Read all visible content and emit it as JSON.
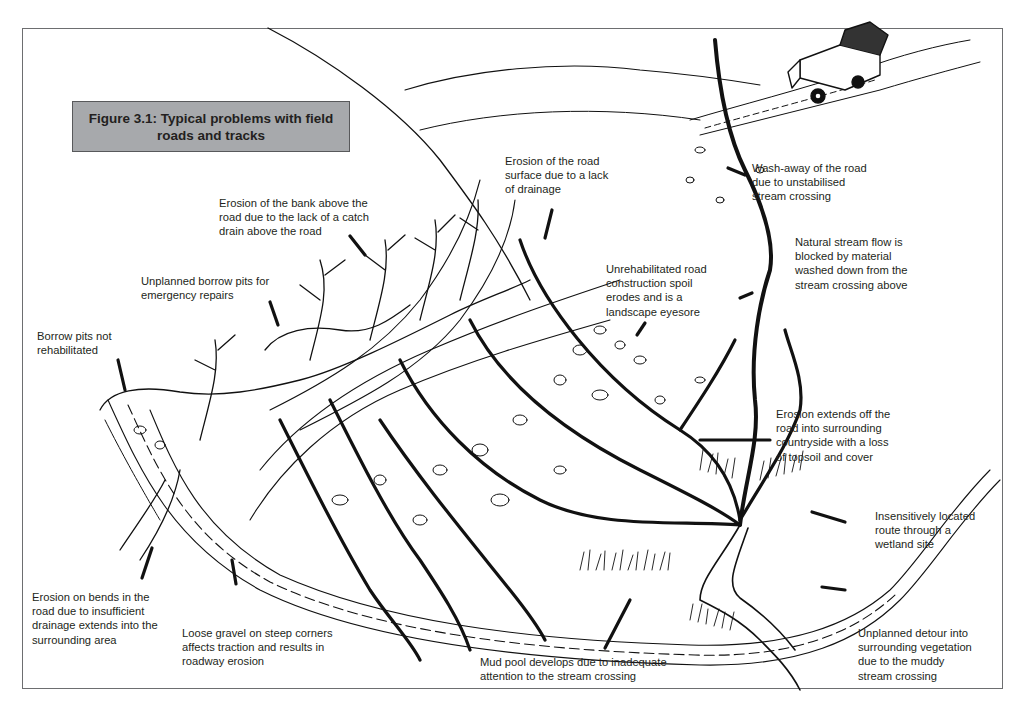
{
  "figure": {
    "title": "Figure 3.1: Typical problems with field\nroads and tracks",
    "colors": {
      "title_box_fill": "#a7a9ac",
      "frame": "#6d6e70",
      "ink": "#111111",
      "text": "#231f20"
    }
  },
  "annotations": [
    {
      "id": "road-surface-erosion",
      "text": "Erosion of the road\nsurface due to a lack\nof drainage"
    },
    {
      "id": "wash-away",
      "text": "Wash-away of the road\ndue to unstabilised\nstream crossing"
    },
    {
      "id": "bank-erosion",
      "text": "Erosion of the bank above the\nroad due to the lack of a catch\ndrain above the road"
    },
    {
      "id": "stream-blocked",
      "text": "Natural stream flow is\nblocked by material\nwashed down from the\nstream crossing above"
    },
    {
      "id": "unplanned-borrow-pits",
      "text": "Unplanned borrow pits for\nemergency repairs"
    },
    {
      "id": "spoil-eyesore",
      "text": "Unrehabilitated road\nconstruction spoil\nerodes and is a\nlandscape eyesore"
    },
    {
      "id": "borrow-pits-not-rehab",
      "text": "Borrow pits not\nrehabilitated"
    },
    {
      "id": "erosion-countryside",
      "text": "Erosion extends off the\nroad into surrounding\ncountryside with a loss\nof topsoil and cover"
    },
    {
      "id": "wetland-route",
      "text": "Insensitively located\nroute through a\nwetland site"
    },
    {
      "id": "bend-erosion",
      "text": "Erosion on bends in the\nroad due to insufficient\ndrainage extends into the\nsurrounding area"
    },
    {
      "id": "loose-gravel",
      "text": "Loose gravel on steep corners\naffects traction and results in\nroadway erosion"
    },
    {
      "id": "mud-pool",
      "text": "Mud pool develops due to inadequate\nattention to the stream crossing"
    },
    {
      "id": "unplanned-detour",
      "text": "Unplanned detour into\nsurrounding vegetation\ndue to the muddy\nstream crossing"
    }
  ],
  "illustration": {
    "elements": [
      "hillside",
      "winding-road",
      "land-rover-vehicle",
      "stream",
      "gullies",
      "borrow-pits",
      "spoil-boulders",
      "wetland-grass",
      "mud-pool"
    ]
  }
}
